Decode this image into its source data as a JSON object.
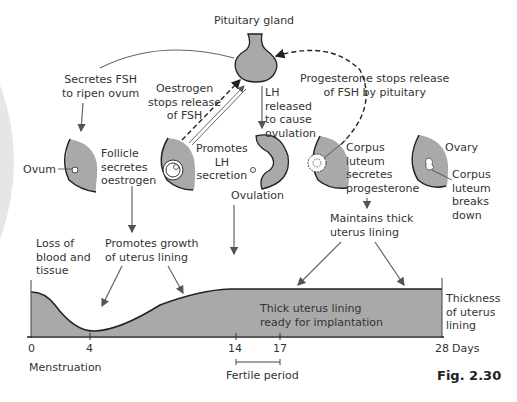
{
  "diagram": {
    "title_node": "Pituitary gland",
    "annotations": {
      "secretes_fsh": "Secretes FSH\nto ripen ovum",
      "oestrogen_stops": "Oestrogen\nstops release\nof FSH",
      "lh_released": "LH\nreleased\nto cause\novulation",
      "progesterone_stops": "Progesterone stops release\nof FSH by pituitary",
      "promotes_lh": "Promotes\nLH\nsecretion",
      "follicle_secretes": "Follicle\nsecretes\noestrogen",
      "ovum": "Ovum",
      "ovulation": "Ovulation",
      "corpus_luteum_secretes": "Corpus\nluteum\nsecretes\nprogesterone",
      "ovary": "Ovary",
      "corpus_luteum_breaks": "Corpus\nluteum\nbreaks\ndown",
      "maintains_lining": "Maintains thick\nuterus lining",
      "promotes_growth": "Promotes growth\nof uterus lining",
      "loss_of_blood": "Loss of\nblood and\ntissue",
      "thick_lining": "Thick uterus lining\nready for implantation",
      "thickness_label": "Thickness\nof uterus\nlining"
    },
    "axis": {
      "ticks": [
        "0",
        "4",
        "14",
        "17",
        "28"
      ],
      "unit": "Days",
      "menstruation": "Menstruation",
      "fertile_period": "Fertile period"
    },
    "figure_label": "Fig. 2.30",
    "colors": {
      "fill": "#a9a9a9",
      "stroke": "#222222",
      "arrow": "#666666"
    }
  }
}
